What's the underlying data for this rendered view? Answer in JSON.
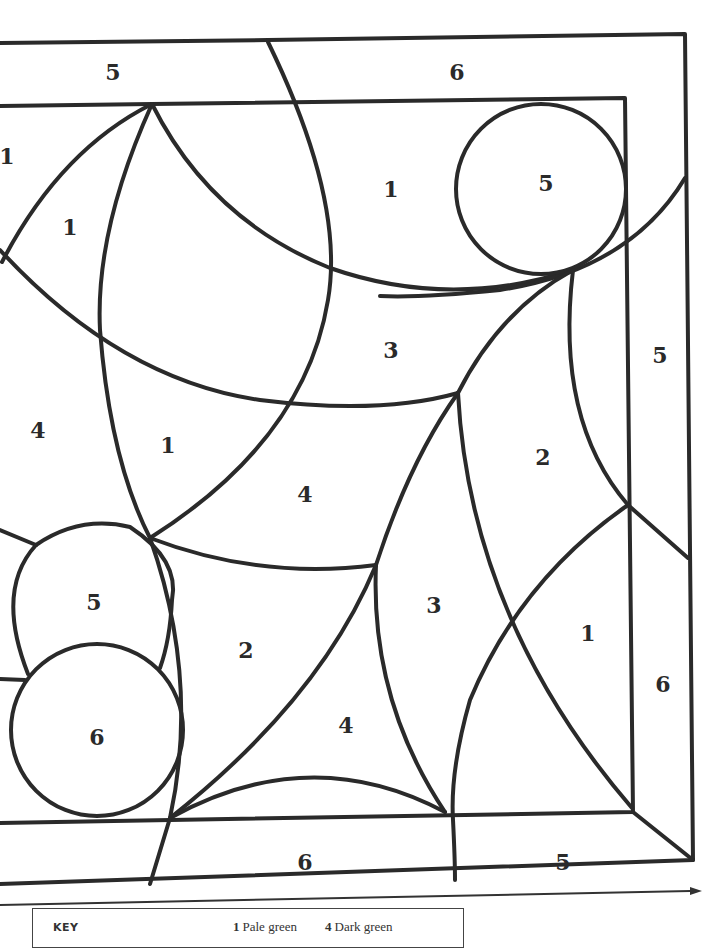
{
  "artwork": {
    "title": "Color-by-number stained glass panel",
    "regions": [
      {
        "id": "top-band-left",
        "number": "5",
        "x": 113,
        "y": 72
      },
      {
        "id": "top-band-right",
        "number": "6",
        "x": 457,
        "y": 72
      },
      {
        "id": "far-left-top",
        "number": "1",
        "x": 7,
        "y": 156
      },
      {
        "id": "left-upper-petal",
        "number": "1",
        "x": 70,
        "y": 227
      },
      {
        "id": "upper-middle",
        "number": "1",
        "x": 391,
        "y": 189
      },
      {
        "id": "top-right-circle",
        "number": "5",
        "x": 546,
        "y": 183
      },
      {
        "id": "right-band-upper",
        "number": "5",
        "x": 660,
        "y": 355
      },
      {
        "id": "center-band",
        "number": "3",
        "x": 391,
        "y": 350
      },
      {
        "id": "left-middle",
        "number": "4",
        "x": 38,
        "y": 430
      },
      {
        "id": "left-center-petal",
        "number": "1",
        "x": 168,
        "y": 445
      },
      {
        "id": "center",
        "number": "4",
        "x": 305,
        "y": 494
      },
      {
        "id": "right-middle",
        "number": "2",
        "x": 543,
        "y": 457
      },
      {
        "id": "left-lower-circle",
        "number": "5",
        "x": 94,
        "y": 602
      },
      {
        "id": "lower-center-left",
        "number": "2",
        "x": 246,
        "y": 650
      },
      {
        "id": "lower-center",
        "number": "3",
        "x": 434,
        "y": 605
      },
      {
        "id": "lower-right",
        "number": "1",
        "x": 588,
        "y": 633
      },
      {
        "id": "right-band-lower",
        "number": "6",
        "x": 663,
        "y": 684
      },
      {
        "id": "bottom-left-circle",
        "number": "6",
        "x": 97,
        "y": 737
      },
      {
        "id": "lower-diamond",
        "number": "4",
        "x": 346,
        "y": 725
      },
      {
        "id": "bottom-band-center",
        "number": "6",
        "x": 305,
        "y": 862
      },
      {
        "id": "bottom-band-right",
        "number": "5",
        "x": 563,
        "y": 862
      }
    ]
  },
  "key": {
    "title": "KEY",
    "items": [
      {
        "number": "1",
        "label": "Pale green"
      },
      {
        "number": "4",
        "label": "Dark green"
      }
    ]
  }
}
